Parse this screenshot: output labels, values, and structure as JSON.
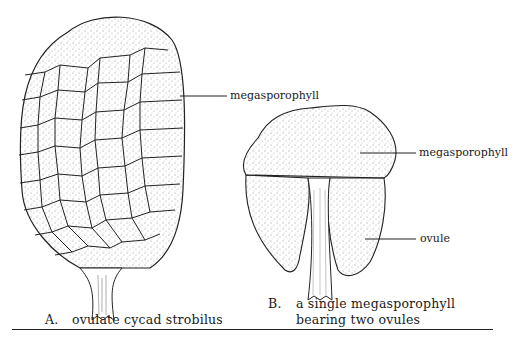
{
  "figure": {
    "panel_a": {
      "caption_letter": "A.",
      "caption_text": "ovulate cycad strobilus",
      "labels": [
        {
          "text": "megasporophyll"
        }
      ]
    },
    "panel_b": {
      "caption_letter": "B.",
      "caption_line1": "a single megasporophyll",
      "caption_line2": "bearing two ovules",
      "labels": [
        {
          "text": "megasporophyll"
        },
        {
          "text": "ovule"
        }
      ]
    }
  },
  "colors": {
    "ink": "#1a1a1a",
    "background": "#ffffff"
  }
}
